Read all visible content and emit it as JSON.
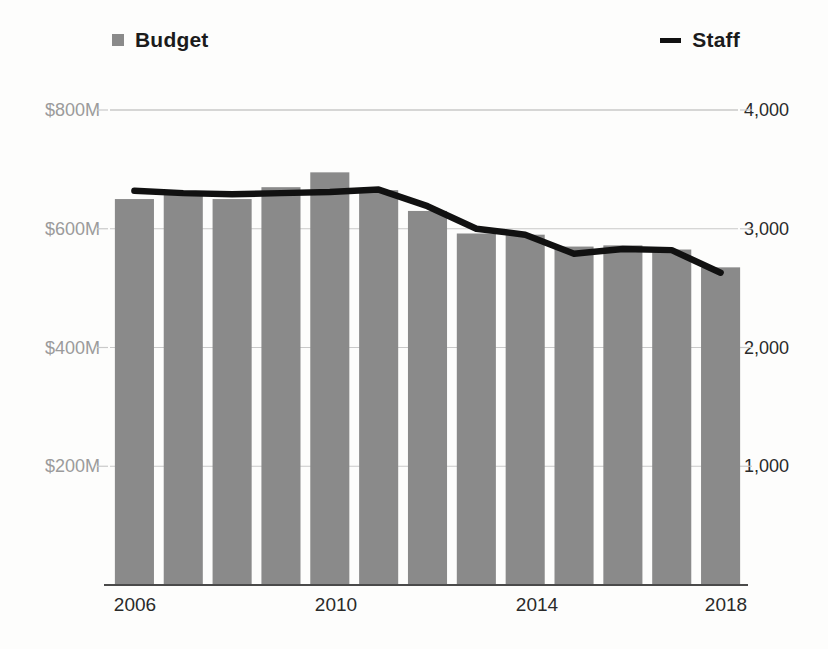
{
  "legend": {
    "budget_label": "Budget",
    "staff_label": "Staff",
    "budget_marker": "square-marker-icon",
    "staff_marker": "line-marker-icon"
  },
  "axes": {
    "y_left_ticks": [
      "$800M",
      "$600M",
      "$400M",
      "$200M"
    ],
    "y_right_ticks": [
      "4,000",
      "3,000",
      "2,000",
      "1,000"
    ],
    "x_ticks": [
      "2006",
      "2010",
      "2014",
      "2018"
    ]
  },
  "colors": {
    "bar": "#8a8a8a",
    "line": "#111111",
    "grid": "#c9c9c9",
    "axis_left_text": "#9b9b9b",
    "axis_right_text": "#2a2a2a",
    "background": "#fdfdfc"
  },
  "chart_data": {
    "type": "bar",
    "title": "",
    "subtitle": "",
    "xlabel": "",
    "ylabel": "",
    "grid": true,
    "legend_position": "top",
    "categories": [
      "2006",
      "2007",
      "2008",
      "2009",
      "2010",
      "2011",
      "2012",
      "2013",
      "2014",
      "2015",
      "2016",
      "2017",
      "2018"
    ],
    "x_tick_labels": [
      "2006",
      "2010",
      "2014",
      "2018"
    ],
    "series": [
      {
        "name": "Budget",
        "type": "bar",
        "axis": "left",
        "unit": "USD millions",
        "axis_label_format": "$#M",
        "ylim": [
          0,
          800
        ],
        "y_ticks": [
          200,
          400,
          600,
          800
        ],
        "y_tick_labels": [
          "$200M",
          "$400M",
          "$600M",
          "$800M"
        ],
        "color": "#8a8a8a",
        "values": [
          650,
          660,
          650,
          670,
          695,
          665,
          630,
          592,
          590,
          570,
          572,
          565,
          535
        ]
      },
      {
        "name": "Staff",
        "type": "line",
        "axis": "right",
        "unit": "employees",
        "ylim": [
          0,
          4000
        ],
        "y_ticks": [
          1000,
          2000,
          3000,
          4000
        ],
        "y_tick_labels": [
          "1,000",
          "2,000",
          "3,000",
          "4,000"
        ],
        "color": "#111111",
        "values": [
          3320,
          3300,
          3290,
          3300,
          3310,
          3330,
          3190,
          3000,
          2950,
          2790,
          2830,
          2820,
          2630
        ]
      }
    ]
  }
}
